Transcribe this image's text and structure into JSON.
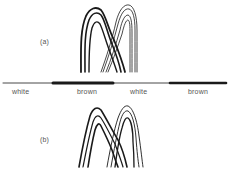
{
  "figure": {
    "panel_a": {
      "label": "(a)"
    },
    "panel_b": {
      "label": "(b)"
    },
    "band": {
      "segments": [
        {
          "label": "white",
          "type": "thin"
        },
        {
          "label": "brown",
          "type": "thick"
        },
        {
          "label": "white",
          "type": "thin"
        },
        {
          "label": "brown",
          "type": "thick"
        }
      ]
    },
    "colors": {
      "ink": "#1a1a1a",
      "label": "#555555",
      "background": "#ffffff"
    }
  }
}
